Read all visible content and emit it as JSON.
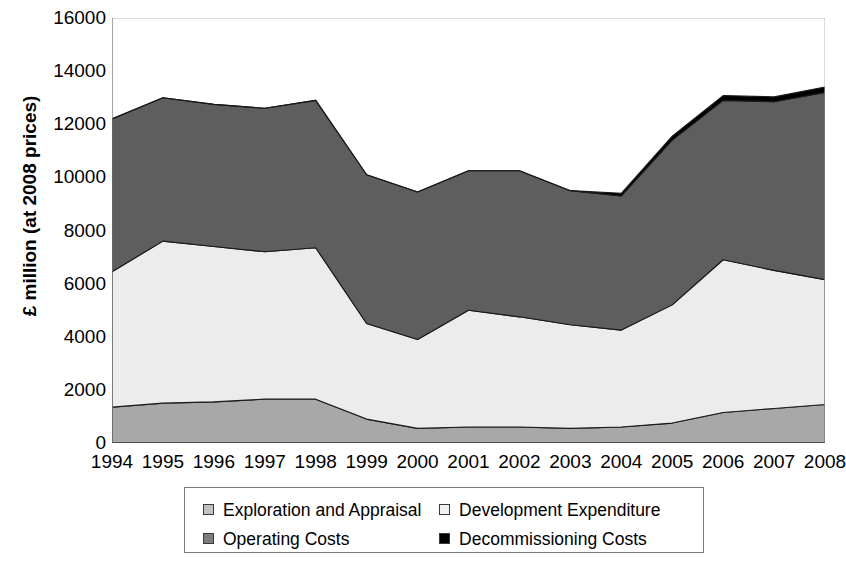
{
  "chart_data": {
    "type": "area",
    "stacked": true,
    "title": "",
    "xlabel": "",
    "ylabel": "£ million (at 2008 prices)",
    "categories": [
      "1994",
      "1995",
      "1996",
      "1997",
      "1998",
      "1999",
      "2000",
      "2001",
      "2002",
      "2003",
      "2004",
      "2005",
      "2006",
      "2007",
      "2008"
    ],
    "ylim": [
      0,
      16000
    ],
    "yticks": [
      0,
      2000,
      4000,
      6000,
      8000,
      10000,
      12000,
      14000,
      16000
    ],
    "ytick_labels": [
      "0",
      "2000",
      "4000",
      "6000",
      "8000",
      "10000",
      "12000",
      "14000",
      "16000"
    ],
    "grid": false,
    "legend_position": "bottom",
    "series": [
      {
        "name": "Exploration and Appraisal",
        "color": "#a8a8a8",
        "values": [
          1350,
          1500,
          1550,
          1650,
          1650,
          900,
          550,
          600,
          600,
          550,
          600,
          750,
          1150,
          1300,
          1450
        ]
      },
      {
        "name": "Development Expenditure",
        "color": "#ececec",
        "values": [
          5100,
          6100,
          5850,
          5550,
          5700,
          3600,
          3350,
          4400,
          4150,
          3900,
          3650,
          4450,
          5750,
          5200,
          4700
        ]
      },
      {
        "name": "Operating Costs",
        "color": "#5e5e5e",
        "values": [
          5750,
          5400,
          5350,
          5400,
          5550,
          5600,
          5550,
          5250,
          5500,
          5050,
          5050,
          6200,
          6000,
          6350,
          7050
        ]
      },
      {
        "name": "Decommissioning Costs",
        "color": "#000000",
        "values": [
          0,
          0,
          0,
          0,
          0,
          0,
          0,
          0,
          0,
          0,
          100,
          150,
          180,
          180,
          200
        ]
      }
    ],
    "totals": [
      12200,
      13000,
      12750,
      12600,
      12900,
      10100,
      9450,
      10250,
      10250,
      9500,
      9400,
      11550,
      13080,
      13030,
      13400
    ]
  },
  "legend": {
    "items": [
      {
        "label": "Exploration and Appraisal",
        "color": "#c2c2c2"
      },
      {
        "label": "Development Expenditure",
        "color": "#f2f2f2"
      },
      {
        "label": "Operating Costs",
        "color": "#7d7d7d"
      },
      {
        "label": "Decommissioning Costs",
        "color": "#000000"
      }
    ]
  },
  "axis": {
    "y_title": "£ million (at 2008 prices)",
    "axis_color": "#9a9a9a",
    "tick_color": "#8a8a8a"
  }
}
